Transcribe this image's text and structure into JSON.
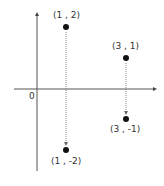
{
  "diagram": {
    "type": "coordinate-plane",
    "origin_label": "0",
    "colors": {
      "axis": "#555555",
      "point": "#111111",
      "arrow": "#888888",
      "text": "#333333"
    },
    "points": [
      {
        "label": "(1 , 2)",
        "x": 1,
        "y": 2
      },
      {
        "label": "(1 , -2)",
        "x": 1,
        "y": -2
      },
      {
        "label": "(3 , 1)",
        "x": 3,
        "y": 1
      },
      {
        "label": "(3 , -1)",
        "x": 3,
        "y": -1
      }
    ],
    "arrows": [
      {
        "from": "(1 , 2)",
        "to": "(1 , -2)",
        "style": "dotted"
      },
      {
        "from": "(3 , 1)",
        "to": "(3 , -1)",
        "style": "dotted"
      }
    ]
  }
}
